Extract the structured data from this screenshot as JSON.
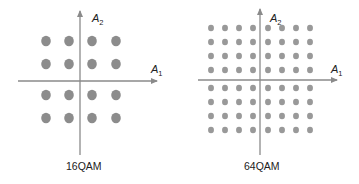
{
  "diagrams": [
    {
      "id": "16qam",
      "caption": "16QAM",
      "x_axis_label": "A",
      "x_axis_sub": "1",
      "y_axis_label": "A",
      "y_axis_sub": "2",
      "grid": {
        "cols": [
          46,
          69,
          92,
          116
        ],
        "rows": [
          41,
          64,
          95,
          118
        ],
        "dot_radius": 5.2
      },
      "dot_color": "#8c8c8c",
      "points": 16
    },
    {
      "id": "64qam",
      "caption": "64QAM",
      "x_axis_label": "A",
      "x_axis_sub": "1",
      "y_axis_label": "A",
      "y_axis_sub": "2",
      "grid": {
        "cols": [
          211,
          225,
          239,
          253,
          268,
          282,
          296,
          310
        ],
        "rows": [
          28,
          42,
          56,
          70,
          88,
          102,
          116,
          130
        ],
        "dot_radius": 3.2
      },
      "dot_color": "#999999",
      "points": 64
    }
  ],
  "colors": {
    "axis": "#8a8a8a",
    "text": "#222222",
    "background": "#ffffff"
  }
}
